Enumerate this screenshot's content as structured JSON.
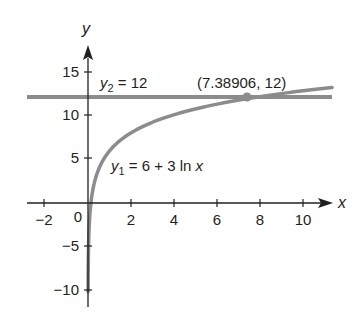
{
  "chart_data": {
    "type": "line",
    "title": "",
    "xlabel": "x",
    "ylabel": "y",
    "xlim": [
      -2.8,
      11.5
    ],
    "ylim": [
      -12,
      18
    ],
    "x_ticks": [
      -2,
      2,
      4,
      6,
      8,
      10
    ],
    "x_tick_labels": [
      "−2",
      "2",
      "4",
      "6",
      "8",
      "10"
    ],
    "y_ticks": [
      15,
      10,
      5,
      -5,
      -10
    ],
    "y_tick_labels": [
      "15",
      "10",
      "5",
      "−5",
      "−10"
    ],
    "origin_label": "0",
    "grid": false,
    "legend": "none (inline labels)",
    "series": [
      {
        "name": "y1 = 6 + 3 ln x",
        "function": "6 + 3*ln(x)",
        "domain": [
          0.02,
          11.3
        ],
        "color": "#8a8a8a",
        "x": [
          0.05,
          0.1,
          0.25,
          0.5,
          1,
          2,
          3,
          4,
          5,
          6,
          7.38906,
          8,
          9,
          10,
          11
        ],
        "values": [
          -2.99,
          -0.91,
          1.84,
          3.92,
          6.0,
          8.08,
          9.3,
          10.16,
          10.83,
          11.38,
          12.0,
          12.24,
          12.59,
          12.91,
          13.19
        ]
      },
      {
        "name": "y2 = 12",
        "function": "12",
        "domain": [
          -2.8,
          11.3
        ],
        "color": "#8a8a8a",
        "x": [
          -2.8,
          11.3
        ],
        "values": [
          12,
          12
        ]
      }
    ],
    "annotations": [
      {
        "text": "(7.38906, 12)",
        "x": 7.38906,
        "y": 12,
        "type": "intersection-point"
      },
      {
        "text": "y2 = 12",
        "near": "horizontal line"
      },
      {
        "text": "y1 = 6 + 3 ln x",
        "near": "log curve"
      }
    ]
  },
  "labels": {
    "x_axis": "x",
    "y_axis": "y",
    "origin": "0",
    "xt_m2": "−2",
    "xt_2": "2",
    "xt_4": "4",
    "xt_6": "6",
    "xt_8": "8",
    "xt_10": "10",
    "yt_15": "15",
    "yt_10": "10",
    "yt_5": "5",
    "yt_m5": "−5",
    "yt_m10": "−10",
    "y2_var": "y",
    "y2_sub": "2",
    "y2_rhs": " = 12",
    "y1_var": "y",
    "y1_sub": "1",
    "y1_rhs": " = 6 + 3 ln ",
    "y1_x": "x",
    "point": "(7.38906, 12)"
  }
}
